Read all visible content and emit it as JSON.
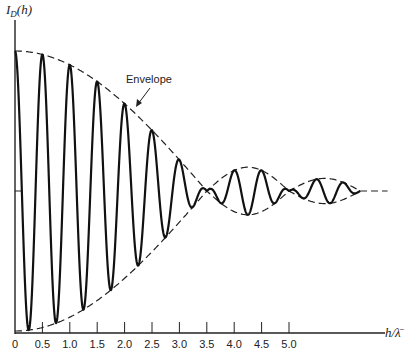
{
  "chart_data": {
    "type": "line",
    "title": "",
    "xlabel": "h/λ̄",
    "ylabel": "I_D(h)",
    "x_ticks": [
      0,
      0.5,
      1.0,
      1.5,
      2.0,
      2.5,
      3.0,
      3.5,
      4.0,
      4.5,
      5.0
    ],
    "x_tick_labels": [
      "0",
      "0.5",
      "1.0",
      "1.5",
      "2.0",
      "2.5",
      "3.0",
      "3.5",
      "4.0",
      "4.5",
      "5.0"
    ],
    "xlim": [
      0,
      6.8
    ],
    "grid": false,
    "legend": null,
    "series": [
      {
        "name": "I_D(h)",
        "style": "solid",
        "description": "Rapid oscillation (period ~0.5 in h/λ̄) whose amplitude follows the envelope; first lobe h 0–3.5, second lobe 3.5–5.0, third lobe 5.0–6.3"
      },
      {
        "name": "Envelope",
        "style": "dashed",
        "lobes": [
          {
            "h_start": 0.0,
            "h_end": 3.5,
            "relative_amplitude": 1.0
          },
          {
            "h_start": 3.5,
            "h_end": 5.0,
            "relative_amplitude": 0.17
          },
          {
            "h_start": 5.0,
            "h_end": 6.3,
            "relative_amplitude": 0.09
          }
        ]
      }
    ],
    "annotations": [
      {
        "text": "Envelope",
        "arrow_to": "envelope curve near h≈2.4"
      }
    ]
  },
  "labels": {
    "ylabel_main": "I",
    "ylabel_sub": "D",
    "ylabel_arg": "(h)",
    "xlabel": "h/λ̄",
    "envelope": "Envelope"
  }
}
